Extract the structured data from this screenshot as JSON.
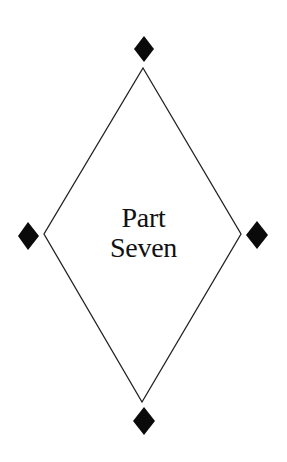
{
  "page": {
    "heading_line1": "Part",
    "heading_line2": "Seven"
  },
  "ornament": {
    "outline_color": "#222222",
    "diamond_color": "#0a0a0a",
    "background": "#ffffff"
  }
}
